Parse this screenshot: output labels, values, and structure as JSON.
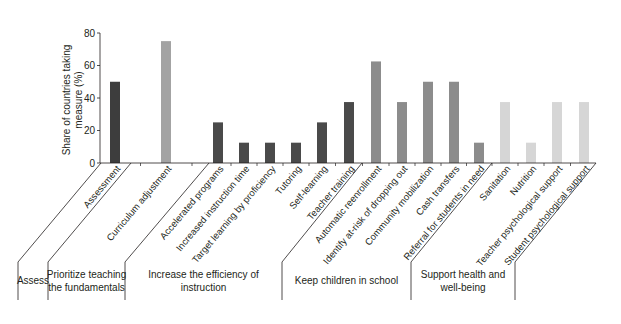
{
  "chart_data": {
    "type": "bar",
    "title": "",
    "xlabel": "",
    "ylabel": "Share of countries taking measure (%)",
    "ylabel_lines": [
      "Share of countries taking",
      "measure (%)"
    ],
    "ylim": [
      0,
      80
    ],
    "yticks": [
      0,
      20,
      40,
      60,
      80
    ],
    "grid": false,
    "legend": "none",
    "categories": [
      "Assessment",
      "Curriculum adjustment",
      "Accelerated programs",
      "Increased instruction time",
      "Target learning by proficiency",
      "Tutoring",
      "Self-learning",
      "Teacher training",
      "Automatic reenrollment",
      "Identify at-risk of dropping out",
      "Community mobilization",
      "Cash transfers",
      "Referral for students in need",
      "Sanitation",
      "Nutrition",
      "Teacher psychological support",
      "Student psychological support"
    ],
    "values": [
      50,
      75,
      25,
      12.5,
      12.5,
      12.5,
      25,
      37.5,
      62.5,
      37.5,
      50,
      50,
      12.5,
      37.5,
      12.5,
      37.5,
      37.5
    ],
    "groups": [
      {
        "name": "Assess",
        "lines": [
          "Assess"
        ],
        "categories": [
          "Assessment"
        ],
        "color": "#3d3d3d"
      },
      {
        "name": "Prioritize teaching the fundamentals",
        "lines": [
          "Prioritize teaching",
          "the fundamentals"
        ],
        "categories": [
          "Curriculum adjustment"
        ],
        "color": "#a3a3a3"
      },
      {
        "name": "Increase the efficiency of instruction",
        "lines": [
          "Increase the efficiency of",
          "instruction"
        ],
        "categories": [
          "Accelerated programs",
          "Increased instruction time",
          "Target learning by proficiency",
          "Tutoring",
          "Self-learning",
          "Teacher training"
        ],
        "color": "#4a4a4a"
      },
      {
        "name": "Keep children in school",
        "lines": [
          "Keep children in school"
        ],
        "categories": [
          "Automatic reenrollment",
          "Identify at-risk of dropping out",
          "Community mobilization",
          "Cash transfers",
          "Referral for students in need"
        ],
        "color": "#8c8c8c"
      },
      {
        "name": "Support health and well-being",
        "lines": [
          "Support health and",
          "well-being"
        ],
        "categories": [
          "Sanitation",
          "Nutrition",
          "Teacher psychological support",
          "Student psychological support"
        ],
        "color": "#d6d6d6"
      }
    ]
  }
}
